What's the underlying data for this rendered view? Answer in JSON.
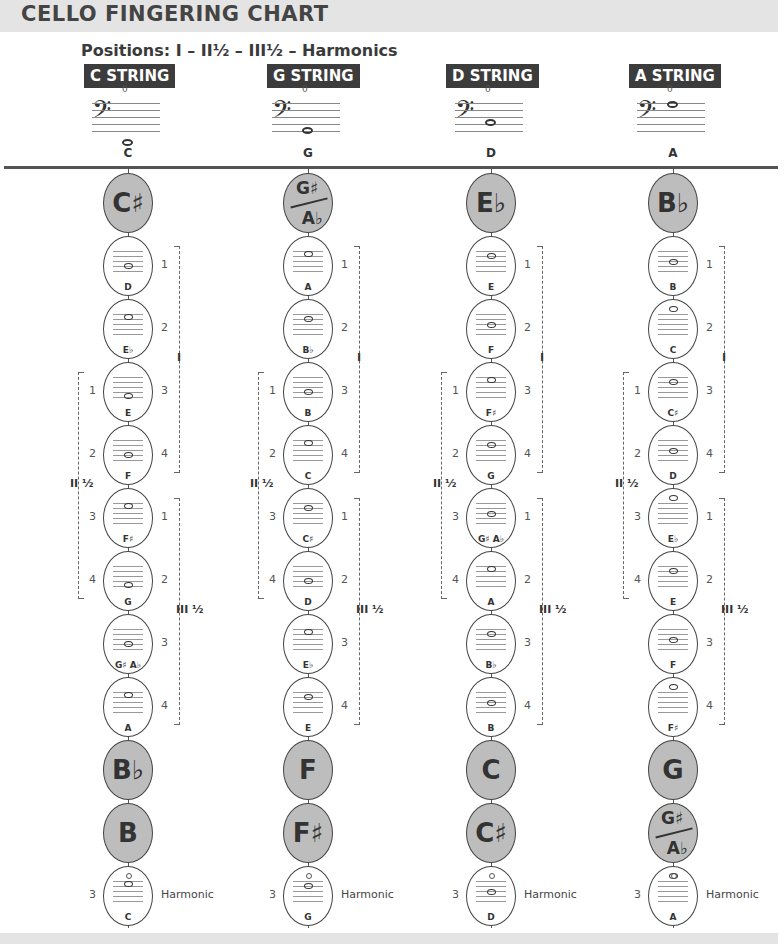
{
  "title": "CELLO FINGERING CHART",
  "positions_label": "Positions:  I – II½ – III½ – Harmonics",
  "harmonic_label": "Harmonic",
  "position_labels": {
    "first": "I",
    "second_half": "II ½",
    "third_half": "III ½"
  },
  "colors": {
    "header_bg": "#3c3c3c",
    "gray_bubble": "#bdbdbd",
    "title_bar": "#e4e4e4"
  },
  "strings": [
    {
      "header": "C STRING",
      "open_note": "C",
      "open_finger": "0",
      "nodes": [
        {
          "type": "gray",
          "name": "C♯"
        },
        {
          "type": "note",
          "name": "D",
          "f_right": "1"
        },
        {
          "type": "note",
          "name": "E♭",
          "f_right": "2"
        },
        {
          "type": "note",
          "name": "E",
          "f_left": "1",
          "f_right": "3"
        },
        {
          "type": "note",
          "name": "F",
          "f_left": "2",
          "f_right": "4"
        },
        {
          "type": "note",
          "name": "F♯",
          "f_left": "3",
          "f_right": "1"
        },
        {
          "type": "note",
          "name": "G",
          "f_left": "4",
          "f_right": "2"
        },
        {
          "type": "note",
          "name": "G♯ A♭",
          "f_right": "3"
        },
        {
          "type": "note",
          "name": "A",
          "f_right": "4"
        },
        {
          "type": "gray",
          "name": "B♭"
        },
        {
          "type": "gray",
          "name": "B"
        },
        {
          "type": "harmonic",
          "name": "C",
          "f_left": "3"
        }
      ]
    },
    {
      "header": "G STRING",
      "open_note": "G",
      "open_finger": "0",
      "nodes": [
        {
          "type": "split",
          "top": "G♯",
          "bottom": "A♭"
        },
        {
          "type": "note",
          "name": "A",
          "f_right": "1"
        },
        {
          "type": "note",
          "name": "B♭",
          "f_right": "2"
        },
        {
          "type": "note",
          "name": "B",
          "f_left": "1",
          "f_right": "3"
        },
        {
          "type": "note",
          "name": "C",
          "f_left": "2",
          "f_right": "4"
        },
        {
          "type": "note",
          "name": "C♯",
          "f_left": "3",
          "f_right": "1"
        },
        {
          "type": "note",
          "name": "D",
          "f_left": "4",
          "f_right": "2"
        },
        {
          "type": "note",
          "name": "E♭",
          "f_right": "3"
        },
        {
          "type": "note",
          "name": "E",
          "f_right": "4"
        },
        {
          "type": "gray",
          "name": "F"
        },
        {
          "type": "gray",
          "name": "F♯"
        },
        {
          "type": "harmonic",
          "name": "G",
          "f_left": "3"
        }
      ]
    },
    {
      "header": "D STRING",
      "open_note": "D",
      "open_finger": "0",
      "nodes": [
        {
          "type": "gray",
          "name": "E♭"
        },
        {
          "type": "note",
          "name": "E",
          "f_right": "1"
        },
        {
          "type": "note",
          "name": "F",
          "f_right": "2"
        },
        {
          "type": "note",
          "name": "F♯",
          "f_left": "1",
          "f_right": "3"
        },
        {
          "type": "note",
          "name": "G",
          "f_left": "2",
          "f_right": "4"
        },
        {
          "type": "note",
          "name": "G♯ A♭",
          "f_left": "3",
          "f_right": "1"
        },
        {
          "type": "note",
          "name": "A",
          "f_left": "4",
          "f_right": "2"
        },
        {
          "type": "note",
          "name": "B♭",
          "f_right": "3"
        },
        {
          "type": "note",
          "name": "B",
          "f_right": "4"
        },
        {
          "type": "gray",
          "name": "C"
        },
        {
          "type": "gray",
          "name": "C♯"
        },
        {
          "type": "harmonic",
          "name": "D",
          "f_left": "3"
        }
      ]
    },
    {
      "header": "A STRING",
      "open_note": "A",
      "open_finger": "0",
      "nodes": [
        {
          "type": "gray",
          "name": "B♭"
        },
        {
          "type": "note",
          "name": "B",
          "f_right": "1"
        },
        {
          "type": "note",
          "name": "C",
          "f_right": "2"
        },
        {
          "type": "note",
          "name": "C♯",
          "f_left": "1",
          "f_right": "3"
        },
        {
          "type": "note",
          "name": "D",
          "f_left": "2",
          "f_right": "4"
        },
        {
          "type": "note",
          "name": "E♭",
          "f_left": "3",
          "f_right": "1"
        },
        {
          "type": "note",
          "name": "E",
          "f_left": "4",
          "f_right": "2"
        },
        {
          "type": "note",
          "name": "F",
          "f_right": "3"
        },
        {
          "type": "note",
          "name": "F♯",
          "f_right": "4"
        },
        {
          "type": "gray",
          "name": "G"
        },
        {
          "type": "split",
          "top": "G♯",
          "bottom": "A♭"
        },
        {
          "type": "harmonic",
          "name": "A",
          "f_left": "3"
        }
      ]
    }
  ]
}
